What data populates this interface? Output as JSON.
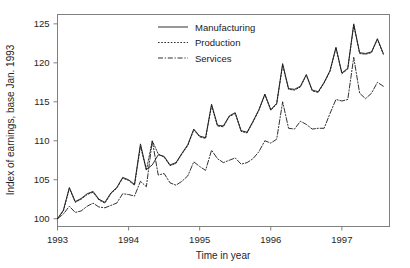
{
  "chart_data": {
    "type": "line",
    "title": "",
    "xlabel": "Time in year",
    "ylabel": "Index of earnings, base Jan. 1993",
    "xlim": [
      1993.0,
      1997.67
    ],
    "ylim": [
      99.0,
      126.2
    ],
    "yticks": [
      100,
      105,
      110,
      115,
      120,
      125
    ],
    "xticks": [
      1993,
      1994,
      1995,
      1996,
      1997
    ],
    "xticklabels": [
      "1993",
      "1994",
      "1995",
      "1996",
      "1997"
    ],
    "yticklabels": [
      "100",
      "105",
      "110",
      "115",
      "120",
      "125"
    ],
    "grid": false,
    "legend_position": "top-center",
    "line_color": "#1a1a1a",
    "frame_color": "#808080",
    "background": "#ffffff",
    "x": [
      1993.0,
      1993.083,
      1993.167,
      1993.25,
      1993.333,
      1993.417,
      1993.5,
      1993.583,
      1993.667,
      1993.75,
      1993.833,
      1993.917,
      1994.0,
      1994.083,
      1994.167,
      1994.25,
      1994.333,
      1994.417,
      1994.5,
      1994.583,
      1994.667,
      1994.75,
      1994.833,
      1994.917,
      1995.0,
      1995.083,
      1995.167,
      1995.25,
      1995.333,
      1995.417,
      1995.5,
      1995.583,
      1995.667,
      1995.75,
      1995.833,
      1995.917,
      1996.0,
      1996.083,
      1996.167,
      1996.25,
      1996.333,
      1996.417,
      1996.5,
      1996.583,
      1996.667,
      1996.75,
      1996.833,
      1996.917,
      1997.0,
      1997.083,
      1997.167,
      1997.25,
      1997.333,
      1997.417,
      1997.5,
      1997.583
    ],
    "series": [
      {
        "name": "Manufacturing",
        "style": "solid",
        "values": [
          100.0,
          101.1,
          104.0,
          102.2,
          102.6,
          103.2,
          103.5,
          102.5,
          102.1,
          103.3,
          104.0,
          105.3,
          105.0,
          104.4,
          109.6,
          106.3,
          106.9,
          108.2,
          108.0,
          106.9,
          107.2,
          108.4,
          109.5,
          111.5,
          110.6,
          110.4,
          114.7,
          112.0,
          111.9,
          113.2,
          113.6,
          111.3,
          111.1,
          112.5,
          114.0,
          116.0,
          114.0,
          114.8,
          119.9,
          116.7,
          116.6,
          117.0,
          118.5,
          116.5,
          116.3,
          117.5,
          119.0,
          122.0,
          118.7,
          119.3,
          125.0,
          121.3,
          121.2,
          121.4,
          123.1,
          121.2
        ]
      },
      {
        "name": "Production",
        "style": "dotted",
        "values": [
          100.0,
          101.0,
          103.9,
          102.1,
          102.5,
          103.1,
          103.4,
          102.4,
          102.0,
          103.2,
          103.9,
          105.2,
          104.9,
          104.3,
          109.3,
          106.2,
          110.0,
          108.3,
          107.9,
          106.8,
          107.1,
          108.3,
          109.4,
          111.4,
          110.5,
          110.3,
          114.5,
          111.9,
          111.8,
          113.1,
          113.5,
          111.2,
          111.0,
          112.4,
          113.9,
          115.9,
          113.9,
          114.7,
          119.7,
          116.6,
          116.5,
          116.9,
          118.4,
          116.4,
          116.2,
          117.4,
          118.9,
          121.9,
          118.6,
          119.2,
          124.8,
          121.2,
          121.1,
          121.3,
          123.0,
          121.1
        ]
      },
      {
        "name": "Services",
        "style": "dashdot",
        "values": [
          100.0,
          100.6,
          101.6,
          100.8,
          101.0,
          101.6,
          102.0,
          101.5,
          101.4,
          101.7,
          102.0,
          103.2,
          103.1,
          102.9,
          104.8,
          104.1,
          110.0,
          105.6,
          105.8,
          104.6,
          104.3,
          104.8,
          105.5,
          107.3,
          106.7,
          106.2,
          108.8,
          107.7,
          107.2,
          107.5,
          107.8,
          107.0,
          107.2,
          107.7,
          108.6,
          110.0,
          109.7,
          110.2,
          115.0,
          111.6,
          111.5,
          112.5,
          112.1,
          111.5,
          111.6,
          111.6,
          113.5,
          115.3,
          115.1,
          115.3,
          120.7,
          116.1,
          115.4,
          116.1,
          117.5,
          117.0
        ]
      }
    ]
  },
  "legend": {
    "items": [
      {
        "label": "Manufacturing",
        "style": "solid"
      },
      {
        "label": "Production",
        "style": "dotted"
      },
      {
        "label": "Services",
        "style": "dashdot"
      }
    ]
  },
  "axes": {
    "y_title": "Index of earnings, base Jan. 1993",
    "x_title": "Time in year"
  }
}
